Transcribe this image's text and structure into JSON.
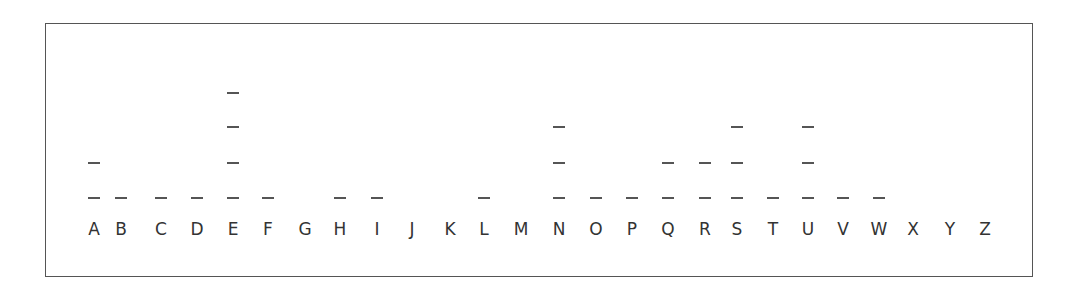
{
  "chart_data": {
    "type": "dot",
    "title": "",
    "xlabel": "",
    "ylabel": "",
    "categories": [
      "A",
      "B",
      "C",
      "D",
      "E",
      "F",
      "G",
      "H",
      "I",
      "J",
      "K",
      "L",
      "M",
      "N",
      "O",
      "P",
      "Q",
      "R",
      "S",
      "T",
      "U",
      "V",
      "W",
      "X",
      "Y",
      "Z"
    ],
    "values": [
      2,
      1,
      1,
      1,
      4,
      1,
      0,
      1,
      1,
      0,
      0,
      1,
      0,
      3,
      1,
      1,
      2,
      2,
      3,
      1,
      3,
      1,
      1,
      0,
      0,
      0
    ],
    "marker": "dash",
    "grid": false,
    "legend": null,
    "ylim": [
      0,
      4
    ]
  },
  "layout": {
    "x_centers": [
      94,
      121,
      161,
      197,
      233,
      268,
      305,
      340,
      377,
      412,
      450,
      484,
      521,
      559,
      596,
      632,
      668,
      705,
      737,
      773,
      808,
      843,
      879,
      913,
      950,
      985
    ],
    "level_y": [
      197,
      162,
      126,
      92
    ],
    "marker_color": "#555555",
    "text_color": "#333333"
  }
}
